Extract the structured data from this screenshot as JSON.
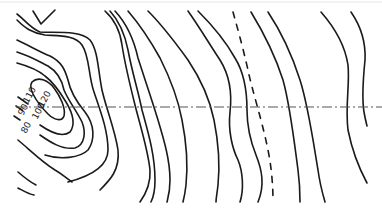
{
  "diagram": {
    "type": "contour-map",
    "contour_labels": [
      {
        "text": "110",
        "x": 30,
        "y": 104,
        "rotate": -62
      },
      {
        "text": "120",
        "x": 45,
        "y": 106,
        "rotate": -62
      },
      {
        "text": "90",
        "x": 22,
        "y": 113,
        "rotate": -62
      },
      {
        "text": "100",
        "x": 36,
        "y": 116,
        "rotate": -62
      },
      {
        "text": "80",
        "x": 26,
        "y": 129,
        "rotate": -62
      }
    ],
    "reference_line": {
      "style": "dash-dot",
      "y": 107
    },
    "colors": {
      "line": "#1a1a1a",
      "axis": "#555555",
      "background": "#ffffff"
    }
  }
}
